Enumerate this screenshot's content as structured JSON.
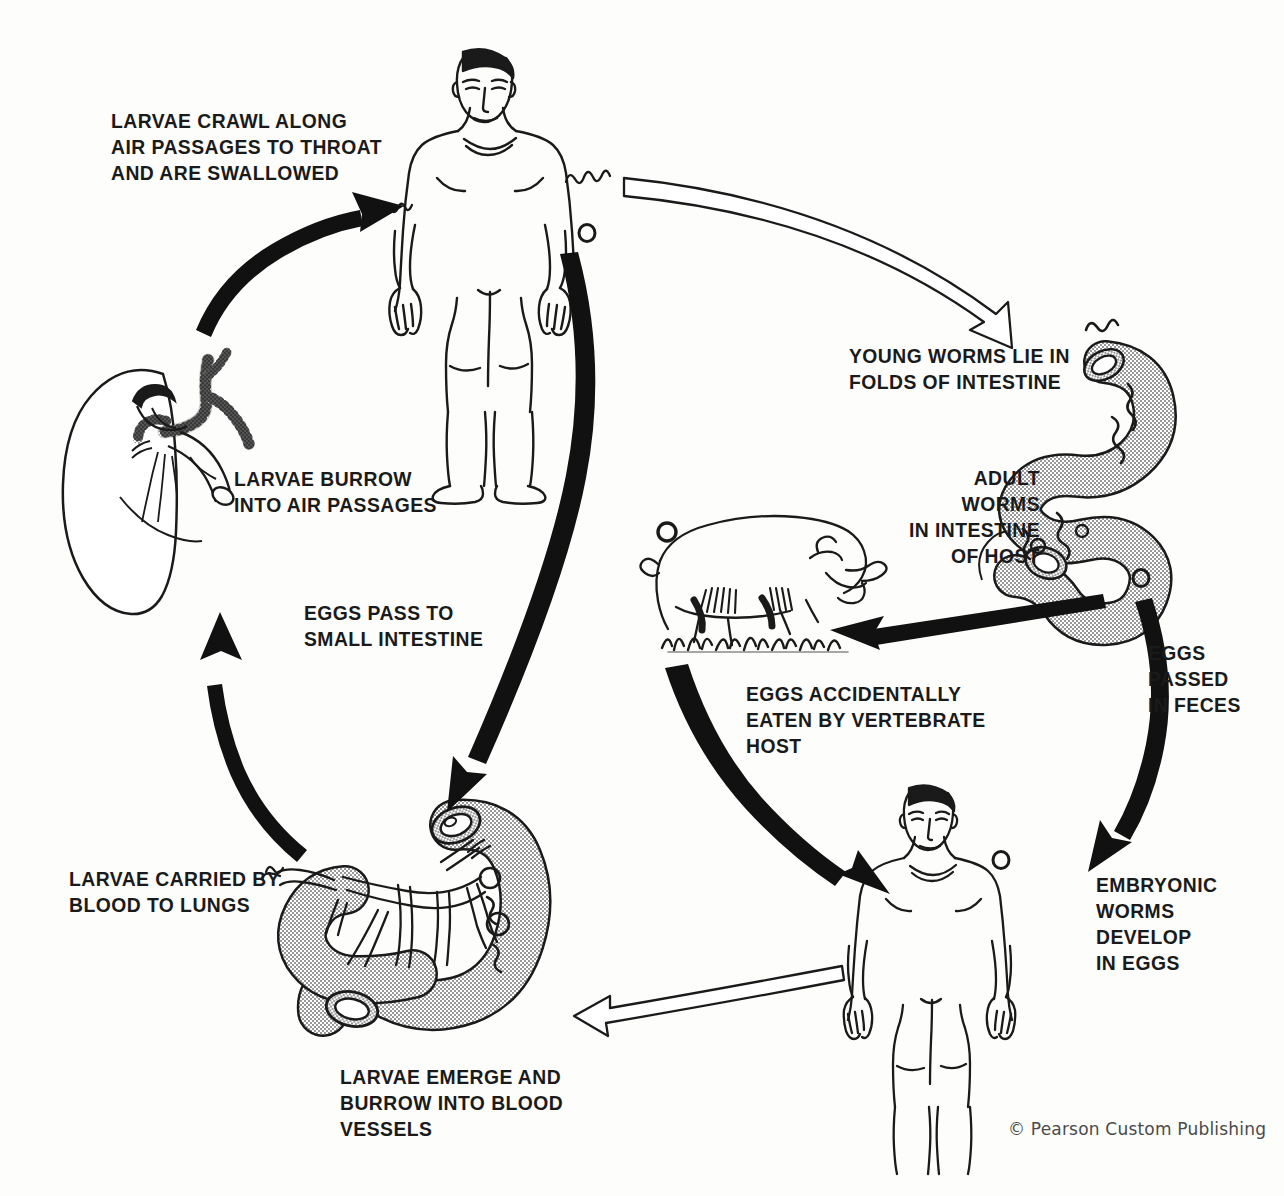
{
  "diagram": {
    "credit": "© Pearson Custom Publishing",
    "colors": {
      "background": "#fdfdfc",
      "ink": "#1a1a1a",
      "organ_fill": "#b9b9b9",
      "arrow_solid": "#111111",
      "arrow_hollow_fill": "#ffffff",
      "credit_text": "#4a4a4a"
    },
    "labels": [
      {
        "id": "larvae-crawl",
        "text": "LARVAE CRAWL ALONG\nAIR PASSAGES TO THROAT\nAND ARE SWALLOWED",
        "align": "left",
        "x": 111,
        "y": 108
      },
      {
        "id": "young-worms",
        "text": "YOUNG WORMS LIE IN\nFOLDS OF INTESTINE",
        "align": "left",
        "x": 849,
        "y": 343
      },
      {
        "id": "adult-worms",
        "text": "ADULT WORMS\nIN INTESTINE\nOF HOST",
        "align": "right",
        "x": 1040,
        "y": 465
      },
      {
        "id": "eggs-passed",
        "text": "EGGS\nPASSED\nIN FECES",
        "align": "left",
        "x": 1148,
        "y": 640
      },
      {
        "id": "embryonic",
        "text": "EMBRYONIC\nWORMS\nDEVELOP\nIN EGGS",
        "align": "left",
        "x": 1096,
        "y": 872
      },
      {
        "id": "eggs-eaten",
        "text": "EGGS ACCIDENTALLY\nEATEN BY VERTEBRATE\nHOST",
        "align": "left",
        "x": 746,
        "y": 681
      },
      {
        "id": "larvae-emerge",
        "text": "LARVAE EMERGE AND\nBURROW INTO BLOOD\nVESSELS",
        "align": "left",
        "x": 340,
        "y": 1064
      },
      {
        "id": "larvae-blood",
        "text": "LARVAE CARRIED BY\nBLOOD TO LUNGS",
        "align": "left",
        "x": 69,
        "y": 866
      },
      {
        "id": "eggs-pass",
        "text": "EGGS PASS TO\nSMALL INTESTINE",
        "align": "left",
        "x": 304,
        "y": 600
      },
      {
        "id": "larvae-burrow",
        "text": "LARVAE BURROW\nINTO AIR PASSAGES",
        "align": "left",
        "x": 234,
        "y": 466
      }
    ],
    "figures": [
      {
        "id": "human-top",
        "name": "human-host-upper",
        "caption_context": "larvae swallowed, worms reach intestine"
      },
      {
        "id": "intestine",
        "name": "coiled-intestine",
        "caption_context": "adult worms in intestine of host"
      },
      {
        "id": "pig",
        "name": "pig-vertebrate-host",
        "caption_context": "eggs accidentally eaten by vertebrate host"
      },
      {
        "id": "human-bottom",
        "name": "human-host-lower",
        "caption_context": "embryonic worms develop in eggs"
      },
      {
        "id": "blood-vessels",
        "name": "intestine-blood-vessels",
        "caption_context": "larvae emerge and burrow into blood vessels"
      },
      {
        "id": "lungs",
        "name": "lung-air-passages",
        "caption_context": "larvae burrow into air passages"
      }
    ],
    "arrows": [
      {
        "id": "a1",
        "style": "solid",
        "from": "lungs",
        "to": "human-top"
      },
      {
        "id": "a2",
        "style": "hollow",
        "from": "human-top",
        "to": "intestine"
      },
      {
        "id": "a3",
        "style": "solid",
        "from": "intestine",
        "to": "pig"
      },
      {
        "id": "a4",
        "style": "solid",
        "from": "intestine",
        "to": "human-bottom"
      },
      {
        "id": "a5",
        "style": "solid",
        "from": "pig",
        "to": "human-bottom"
      },
      {
        "id": "a6",
        "style": "hollow",
        "from": "human-bottom",
        "to": "blood-vessels"
      },
      {
        "id": "a7",
        "style": "solid",
        "from": "human-top",
        "to": "blood-vessels"
      },
      {
        "id": "a8",
        "style": "solid",
        "from": "blood-vessels",
        "to": "lungs"
      }
    ]
  }
}
